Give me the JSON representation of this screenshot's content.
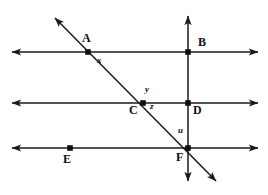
{
  "figure": {
    "width": 268,
    "height": 195,
    "background": "#ffffff",
    "stroke_color": "#1a1a1a",
    "point_color": "#101010",
    "label_color": "#101010"
  },
  "lines": {
    "horizontal": [
      {
        "name": "line-through-A-B",
        "y": 52,
        "x_start": 12,
        "x_end": 258,
        "arrows": "both"
      },
      {
        "name": "line-through-C-D",
        "y": 103,
        "x_start": 12,
        "x_end": 258,
        "arrows": "both"
      },
      {
        "name": "line-through-E-F",
        "y": 148,
        "x_start": 12,
        "x_end": 258,
        "arrows": "both"
      }
    ],
    "vertical": [
      {
        "name": "line-through-B-D-F",
        "x": 188,
        "y_start": 16,
        "y_end": 181,
        "arrows": "both"
      }
    ],
    "diagonal": [
      {
        "name": "transversal-through-A-C-F",
        "x1": 55,
        "y1": 18,
        "x2": 216,
        "y2": 181,
        "arrows": "both"
      }
    ]
  },
  "points": [
    {
      "id": "A",
      "label": "A",
      "x": 88,
      "y": 52,
      "label_x": 82,
      "label_y": 32
    },
    {
      "id": "B",
      "label": "B",
      "x": 188,
      "y": 52,
      "label_x": 198,
      "label_y": 36
    },
    {
      "id": "C",
      "label": "C",
      "x": 143,
      "y": 103,
      "label_x": 129,
      "label_y": 104
    },
    {
      "id": "D",
      "label": "D",
      "x": 188,
      "y": 103,
      "label_x": 193,
      "label_y": 104
    },
    {
      "id": "E",
      "label": "E",
      "x": 70,
      "y": 148,
      "label_x": 63,
      "label_y": 153
    },
    {
      "id": "F",
      "label": "F",
      "x": 188,
      "y": 148,
      "label_x": 176,
      "label_y": 151
    }
  ],
  "angle_labels": [
    {
      "id": "x",
      "label": "x",
      "x": 97,
      "y": 56
    },
    {
      "id": "y",
      "label": "y",
      "x": 145,
      "y": 85
    },
    {
      "id": "z",
      "label": "z",
      "x": 150,
      "y": 102
    },
    {
      "id": "u",
      "label": "u",
      "x": 178,
      "y": 126
    }
  ]
}
